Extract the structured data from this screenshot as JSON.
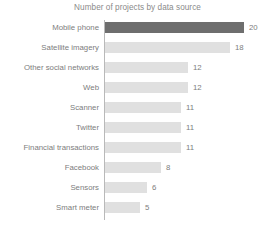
{
  "chart_data": {
    "type": "bar",
    "orientation": "horizontal",
    "title": "Number of projects by data source",
    "xlabel": "",
    "ylabel": "",
    "categories": [
      "Mobile phone",
      "Satellite imagery",
      "Other social networks",
      "Web",
      "Scanner",
      "Twitter",
      "Financial transactions",
      "Facebook",
      "Sensors",
      "Smart meter"
    ],
    "values": [
      20,
      18,
      12,
      12,
      11,
      11,
      11,
      8,
      6,
      5
    ],
    "value_labels": [
      "20",
      "18",
      "12",
      "12",
      "11",
      "11",
      "11",
      "8",
      "6",
      "5"
    ],
    "xlim": [
      0,
      20
    ],
    "grid": false,
    "legend": false,
    "bar_colors": [
      "#6e6e6e",
      "#e0e0e0",
      "#e0e0e0",
      "#e0e0e0",
      "#e0e0e0",
      "#e0e0e0",
      "#e0e0e0",
      "#e0e0e0",
      "#e0e0e0",
      "#e0e0e0"
    ],
    "highlight_index": 0,
    "highlight_color": "#6e6e6e",
    "base_color": "#e0e0e0",
    "axis_color": "#b9b9b9",
    "text_color": "#7d7d7d",
    "title_color": "#8a8a8a"
  }
}
